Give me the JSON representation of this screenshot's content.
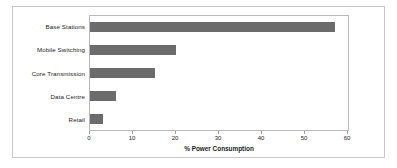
{
  "chart_data": {
    "type": "bar",
    "orientation": "horizontal",
    "title": "",
    "xlabel": "% Power Consumption",
    "ylabel": "",
    "categories": [
      "Base Stations",
      "Mobile Switching",
      "Core Transmission",
      "Data Centre",
      "Retail"
    ],
    "values": [
      57,
      20,
      15,
      6,
      3
    ],
    "xlim": [
      0,
      60
    ],
    "xticks": [
      0,
      10,
      20,
      30,
      40,
      50,
      60
    ],
    "xtick_labels": [
      "0",
      "10",
      "20",
      "30",
      "40",
      "50",
      "60"
    ],
    "grid": false,
    "legend": false,
    "bar_color": "#6b6b6b",
    "plot_background": "#ffffff",
    "frame_color": "#b9b9b9",
    "outer_border_color": "#c9c9c9"
  }
}
